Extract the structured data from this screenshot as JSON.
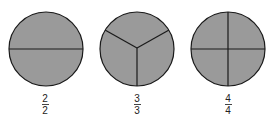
{
  "colors": {
    "fill": "#9a9a9a",
    "stroke": "#1a1a1a",
    "background": "#ffffff"
  },
  "circles": [
    {
      "name": "halves",
      "parts": 2,
      "divisions": "horizontal-line",
      "label": {
        "numerator": "2",
        "denominator": "2"
      }
    },
    {
      "name": "thirds",
      "parts": 3,
      "divisions": "three-radii",
      "label": {
        "numerator": "3",
        "denominator": "3"
      }
    },
    {
      "name": "fourths",
      "parts": 4,
      "divisions": "cross",
      "label": {
        "numerator": "4",
        "denominator": "4"
      }
    }
  ]
}
